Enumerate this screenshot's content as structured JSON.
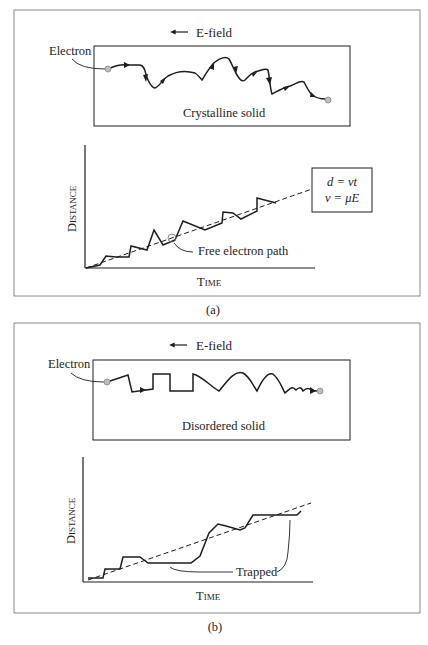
{
  "figure": {
    "panels": [
      {
        "id": "a",
        "caption": "(a)",
        "field_label": "E-field",
        "field_direction": "left",
        "electron_label": "Electron",
        "solid_label": "Crystalline solid",
        "graph": {
          "ylabel": "Distance",
          "xlabel": "Time",
          "path_label": "Free electron path",
          "equations": [
            "d = vt",
            "v = μE"
          ]
        }
      },
      {
        "id": "b",
        "caption": "(b)",
        "field_label": "E-field",
        "field_direction": "left",
        "electron_label": "Electron",
        "solid_label": "Disordered solid",
        "graph": {
          "ylabel": "Distance",
          "xlabel": "Time",
          "trap_label": "Trapped"
        }
      }
    ]
  },
  "colors": {
    "ink": "#1e1e1e",
    "frame": "#8a8a8a",
    "electron": "#9a9a9a"
  }
}
